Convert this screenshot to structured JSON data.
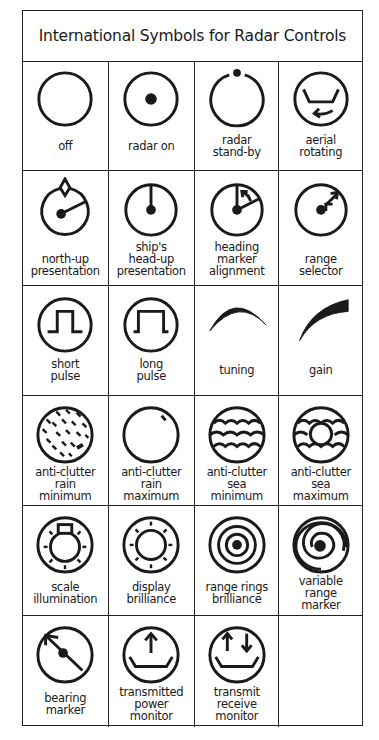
{
  "title": "International Symbols for Radar Controls",
  "rows": [
    {
      "height": 109,
      "cells": [
        {
          "symbol": "off-icon",
          "lines": [
            "off"
          ],
          "labelTop": 78
        },
        {
          "symbol": "radar-on-icon",
          "lines": [
            "radar on"
          ],
          "labelTop": 78
        },
        {
          "symbol": "radar-standby-icon",
          "lines": [
            "radar",
            "stand-by"
          ],
          "labelTop": 72
        },
        {
          "symbol": "aerial-rotating-icon",
          "lines": [
            "aerial",
            "rotating"
          ],
          "labelTop": 72
        }
      ]
    },
    {
      "height": 115,
      "cells": [
        {
          "symbol": "north-up-presentation-icon",
          "lines": [
            "north-up",
            "presentation"
          ],
          "labelTop": 82
        },
        {
          "symbol": "head-up-presentation-icon",
          "lines": [
            "ship's",
            "head-up",
            "presentation"
          ],
          "labelTop": 70
        },
        {
          "symbol": "heading-marker-alignment-icon",
          "lines": [
            "heading",
            "marker",
            "alignment"
          ],
          "labelTop": 70
        },
        {
          "symbol": "range-selector-icon",
          "lines": [
            "range",
            "selector"
          ],
          "labelTop": 82
        }
      ]
    },
    {
      "height": 110,
      "cells": [
        {
          "symbol": "short-pulse-icon",
          "lines": [
            "short",
            "pulse"
          ],
          "labelTop": 72
        },
        {
          "symbol": "long-pulse-icon",
          "lines": [
            "long",
            "pulse"
          ],
          "labelTop": 72
        },
        {
          "symbol": "tuning-icon",
          "lines": [
            "tuning"
          ],
          "labelTop": 78
        },
        {
          "symbol": "gain-icon",
          "lines": [
            "gain"
          ],
          "labelTop": 78
        }
      ]
    },
    {
      "height": 110,
      "cells": [
        {
          "symbol": "anti-clutter-rain-minimum-icon",
          "lines": [
            "anti-clutter",
            "rain",
            "minimum"
          ],
          "labelTop": 70
        },
        {
          "symbol": "anti-clutter-rain-maximum-icon",
          "lines": [
            "anti-clutter",
            "rain",
            "maximum"
          ],
          "labelTop": 70
        },
        {
          "symbol": "anti-clutter-sea-minimum-icon",
          "lines": [
            "anti-clutter",
            "sea",
            "minimum"
          ],
          "labelTop": 70
        },
        {
          "symbol": "anti-clutter-sea-maximum-icon",
          "lines": [
            "anti-clutter",
            "sea",
            "maximum"
          ],
          "labelTop": 70
        }
      ]
    },
    {
      "height": 110,
      "cells": [
        {
          "symbol": "scale-illumination-icon",
          "lines": [
            "scale",
            "illumination"
          ],
          "labelTop": 75
        },
        {
          "symbol": "display-brilliance-icon",
          "lines": [
            "display",
            "brilliance"
          ],
          "labelTop": 75
        },
        {
          "symbol": "range-rings-brilliance-icon",
          "lines": [
            "range rings",
            "brilliance"
          ],
          "labelTop": 75
        },
        {
          "symbol": "variable-range-marker-icon",
          "lines": [
            "variable",
            "range",
            "marker"
          ],
          "labelTop": 69
        }
      ]
    },
    {
      "height": 111,
      "cells": [
        {
          "symbol": "bearing-marker-icon",
          "lines": [
            "bearing",
            "marker"
          ],
          "labelTop": 76
        },
        {
          "symbol": "transmitted-power-monitor-icon",
          "lines": [
            "transmitted",
            "power",
            "monitor"
          ],
          "labelTop": 70
        },
        {
          "symbol": "transmit-receive-monitor-icon",
          "lines": [
            "transmit",
            "receive",
            "monitor"
          ],
          "labelTop": 70
        },
        {
          "symbol": "empty",
          "lines": [],
          "labelTop": 0
        }
      ]
    }
  ],
  "colors": {
    "ink": "#1a1a1a",
    "background": "#ffffff",
    "border": "#222222"
  }
}
